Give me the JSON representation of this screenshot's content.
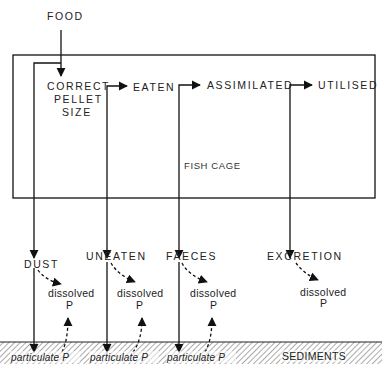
{
  "diagram": {
    "input": {
      "label": "FOOD"
    },
    "cage": {
      "label": "FISH CAGE"
    },
    "stages": [
      {
        "id": "correct",
        "lines": [
          "CORRECT",
          "PELLET",
          "SIZE"
        ]
      },
      {
        "id": "eaten",
        "label": "EATEN"
      },
      {
        "id": "assimilated",
        "label": "ASSIMILATED"
      },
      {
        "id": "utilised",
        "label": "UTILISED"
      }
    ],
    "losses": [
      {
        "id": "dust",
        "label": "DUST",
        "dissolved": [
          "dissolved",
          "P"
        ],
        "particulate": "particulate P",
        "dissolved_return": true
      },
      {
        "id": "uneaten",
        "label": "UNEATEN",
        "dissolved": [
          "dissolved",
          "P"
        ],
        "particulate": "particulate P",
        "dissolved_return": true
      },
      {
        "id": "faeces",
        "label": "FAECES",
        "dissolved": [
          "dissolved",
          "P"
        ],
        "particulate": "particulate P",
        "dissolved_return": true
      },
      {
        "id": "excretion",
        "label": "EXCRETION",
        "dissolved": [
          "dissolved",
          "P"
        ],
        "dissolved_return": false
      }
    ],
    "sediments": {
      "label": "SEDIMENTS"
    },
    "colors": {
      "ink": "#111111",
      "background": "#ffffff"
    }
  }
}
